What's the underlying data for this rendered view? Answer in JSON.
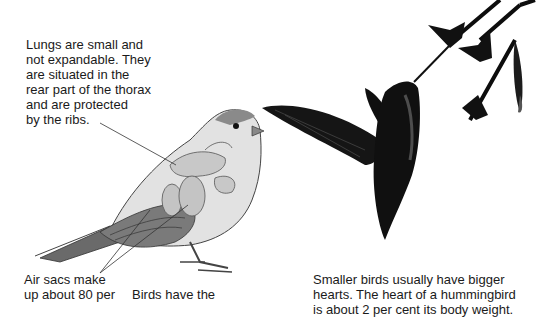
{
  "captions": {
    "lungs": "Lungs are small and\nnot expandable. They\nare situated in the\nrear part of the thorax\nand are protected\nby the ribs.",
    "air_sacs": "Air sacs make\nup about 80 per",
    "birds_have": "Birds have the",
    "heart": "Smaller birds usually have bigger\nhearts. The heart of a hummingbird\nis about 2 per cent its body weight."
  },
  "illustrations": {
    "left": "sparrow-anatomy-illustration",
    "right": "hummingbird-feeding-on-flower"
  },
  "colors": {
    "text": "#1a1a1a",
    "background": "#ffffff",
    "bird_body": "#d8d8d8",
    "bird_dark": "#555555",
    "hummingbird": "#0d0d0d"
  }
}
